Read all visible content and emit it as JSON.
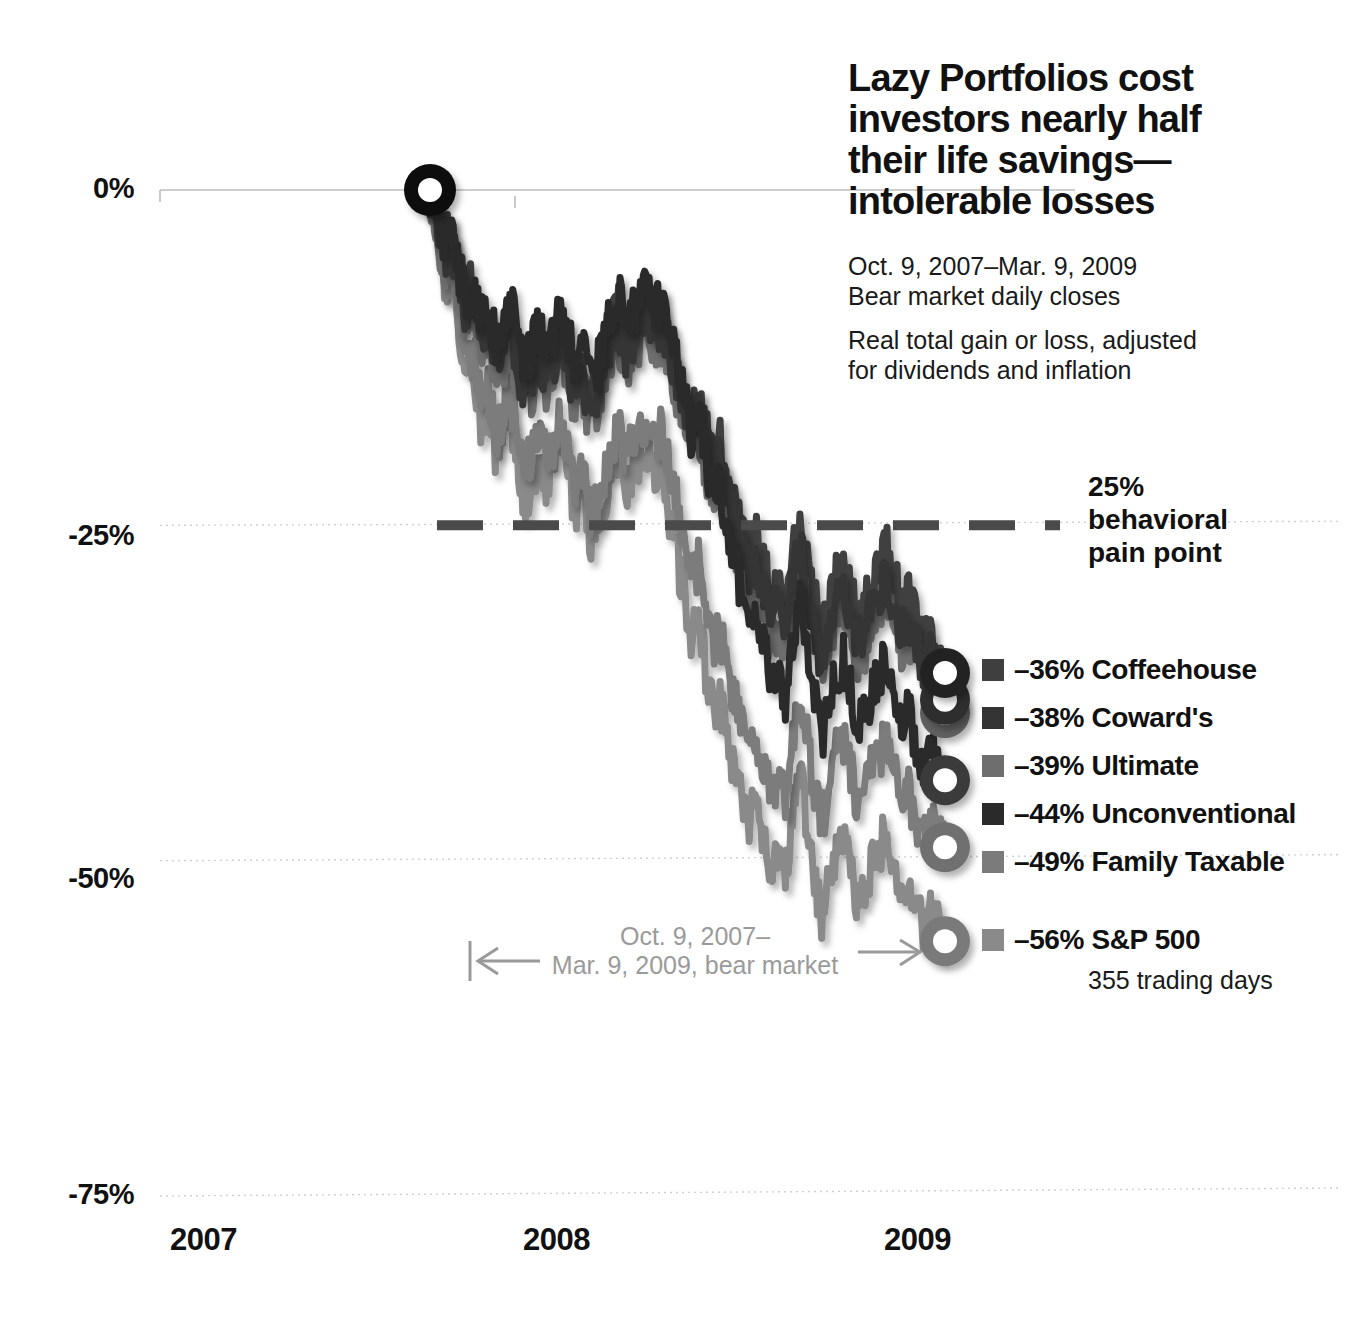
{
  "headline": {
    "line1": "Lazy Portfolios cost",
    "line2": "investors nearly half",
    "line3": "their life savings—",
    "line4": "intolerable losses"
  },
  "subtitle": {
    "daterange": "Oct. 9, 2007–Mar. 9, 2009",
    "basis": "Bear market daily closes",
    "note_line1": "Real total gain or loss, adjusted",
    "note_line2": "for dividends and inflation"
  },
  "annotations": {
    "pain_point": {
      "value": "25%",
      "line2": "behavioral",
      "line3": "pain point"
    },
    "bear_market": {
      "line1": "Oct. 9, 2007–",
      "line2": "Mar. 9, 2009, bear market"
    },
    "trading_days": "355 trading days"
  },
  "legend": {
    "items": [
      {
        "value": "–36%",
        "label": "Coffeehouse",
        "color": "#3f3f3f"
      },
      {
        "value": "–38%",
        "label": "Coward's",
        "color": "#343434"
      },
      {
        "value": "–39%",
        "label": "Ultimate",
        "color": "#6e6e6e"
      },
      {
        "value": "–44%",
        "label": "Unconventional",
        "color": "#2a2a2a"
      },
      {
        "value": "–49%",
        "label": "Family Taxable",
        "color": "#7b7b7b"
      },
      {
        "value": "–56%",
        "label": "S&P 500",
        "color": "#8a8a8a"
      }
    ]
  },
  "chart_data": {
    "type": "line",
    "subtitle": "Oct. 9, 2007–Mar. 9, 2009 Bear market daily closes",
    "xlabel": "",
    "ylabel": "Real total gain or loss, adjusted for dividends and inflation",
    "ylim": [
      -75,
      0
    ],
    "yticks": [
      0,
      -25,
      -50,
      -75
    ],
    "ytick_labels": [
      "0%",
      "-25%",
      "-50%",
      "-75%"
    ],
    "xticks": [
      "2007",
      "2008",
      "2009"
    ],
    "grid": true,
    "legend_position": "right",
    "reference_line": {
      "value": -25,
      "label": "25% behavioral pain point",
      "style": "dashed",
      "color": "#444444"
    },
    "start_marker": {
      "x": 0,
      "y": 0,
      "label": "Oct. 9, 2007"
    },
    "series": [
      {
        "name": "Coffeehouse",
        "final": -36,
        "color": "#3f3f3f",
        "values": [
          0,
          -2,
          -4,
          -3,
          -6,
          -8,
          -7,
          -10,
          -9,
          -12,
          -11,
          -9,
          -12,
          -14,
          -13,
          -11,
          -13,
          -12,
          -10,
          -12,
          -14,
          -13,
          -15,
          -14,
          -12,
          -10,
          -9,
          -11,
          -10,
          -9,
          -8,
          -10,
          -9,
          -11,
          -13,
          -15,
          -17,
          -16,
          -18,
          -20,
          -19,
          -21,
          -23,
          -25,
          -27,
          -26,
          -28,
          -30,
          -29,
          -31,
          -27,
          -25,
          -28,
          -30,
          -33,
          -31,
          -29,
          -28,
          -30,
          -32,
          -31,
          -29,
          -28,
          -27,
          -29,
          -31,
          -30,
          -32,
          -34,
          -33,
          -35,
          -36
        ]
      },
      {
        "name": "Coward's",
        "final": -38,
        "color": "#343434",
        "values": [
          0,
          -2,
          -5,
          -4,
          -7,
          -9,
          -8,
          -11,
          -10,
          -13,
          -12,
          -10,
          -13,
          -15,
          -14,
          -12,
          -14,
          -13,
          -11,
          -13,
          -15,
          -14,
          -16,
          -15,
          -13,
          -11,
          -10,
          -12,
          -11,
          -10,
          -9,
          -11,
          -10,
          -12,
          -14,
          -16,
          -18,
          -17,
          -19,
          -21,
          -20,
          -23,
          -25,
          -27,
          -29,
          -28,
          -30,
          -32,
          -31,
          -33,
          -29,
          -27,
          -30,
          -33,
          -35,
          -33,
          -31,
          -30,
          -32,
          -34,
          -33,
          -31,
          -30,
          -29,
          -31,
          -33,
          -32,
          -34,
          -36,
          -35,
          -37,
          -38
        ]
      },
      {
        "name": "Ultimate",
        "final": -39,
        "color": "#6e6e6e",
        "values": [
          0,
          -3,
          -6,
          -5,
          -8,
          -10,
          -9,
          -12,
          -11,
          -14,
          -13,
          -11,
          -14,
          -16,
          -15,
          -13,
          -15,
          -14,
          -12,
          -14,
          -16,
          -15,
          -17,
          -16,
          -14,
          -12,
          -11,
          -13,
          -12,
          -11,
          -10,
          -12,
          -11,
          -13,
          -15,
          -17,
          -19,
          -18,
          -21,
          -23,
          -22,
          -25,
          -27,
          -29,
          -31,
          -30,
          -32,
          -34,
          -33,
          -35,
          -31,
          -28,
          -31,
          -34,
          -36,
          -34,
          -32,
          -31,
          -33,
          -35,
          -34,
          -32,
          -31,
          -30,
          -32,
          -34,
          -33,
          -35,
          -37,
          -36,
          -38,
          -39
        ]
      },
      {
        "name": "Unconventional",
        "final": -44,
        "color": "#2a2a2a",
        "values": [
          0,
          -2,
          -4,
          -3,
          -6,
          -8,
          -7,
          -10,
          -9,
          -11,
          -10,
          -8,
          -11,
          -13,
          -12,
          -10,
          -12,
          -11,
          -9,
          -11,
          -13,
          -12,
          -14,
          -13,
          -11,
          -9,
          -8,
          -10,
          -9,
          -8,
          -7,
          -9,
          -8,
          -10,
          -13,
          -15,
          -18,
          -17,
          -20,
          -23,
          -22,
          -25,
          -28,
          -30,
          -33,
          -32,
          -34,
          -37,
          -36,
          -38,
          -34,
          -31,
          -34,
          -38,
          -41,
          -39,
          -36,
          -35,
          -37,
          -40,
          -39,
          -37,
          -36,
          -35,
          -37,
          -40,
          -39,
          -41,
          -43,
          -42,
          -43,
          -44
        ]
      },
      {
        "name": "Family Taxable",
        "final": -49,
        "color": "#7b7b7b",
        "values": [
          0,
          -3,
          -7,
          -6,
          -10,
          -13,
          -12,
          -16,
          -15,
          -18,
          -17,
          -15,
          -18,
          -21,
          -20,
          -18,
          -20,
          -19,
          -17,
          -19,
          -22,
          -21,
          -24,
          -23,
          -21,
          -19,
          -18,
          -20,
          -19,
          -18,
          -17,
          -19,
          -18,
          -20,
          -23,
          -26,
          -29,
          -28,
          -31,
          -34,
          -33,
          -36,
          -38,
          -40,
          -42,
          -41,
          -43,
          -45,
          -44,
          -46,
          -41,
          -38,
          -41,
          -45,
          -47,
          -45,
          -42,
          -41,
          -43,
          -46,
          -45,
          -43,
          -42,
          -41,
          -43,
          -46,
          -45,
          -47,
          -48,
          -47,
          -48,
          -49
        ]
      },
      {
        "name": "S&P 500",
        "final": -56,
        "color": "#8a8a8a",
        "values": [
          0,
          -3,
          -7,
          -6,
          -11,
          -14,
          -13,
          -17,
          -16,
          -20,
          -19,
          -17,
          -20,
          -23,
          -22,
          -20,
          -22,
          -21,
          -19,
          -21,
          -24,
          -23,
          -26,
          -25,
          -23,
          -21,
          -20,
          -22,
          -21,
          -20,
          -19,
          -22,
          -21,
          -24,
          -27,
          -30,
          -33,
          -32,
          -36,
          -39,
          -38,
          -41,
          -43,
          -45,
          -47,
          -46,
          -48,
          -51,
          -50,
          -52,
          -47,
          -44,
          -47,
          -51,
          -54,
          -52,
          -49,
          -48,
          -50,
          -53,
          -52,
          -50,
          -49,
          -48,
          -50,
          -53,
          -52,
          -54,
          -55,
          -54,
          -55,
          -56
        ]
      }
    ]
  }
}
